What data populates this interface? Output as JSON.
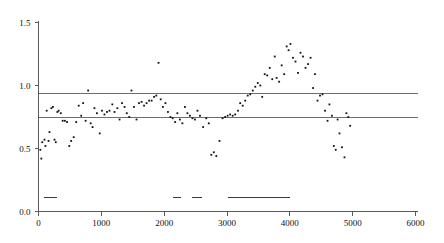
{
  "chart_data": {
    "type": "scatter",
    "title": "",
    "subtitle": "",
    "xlabel": "",
    "ylabel": "",
    "xlim": [
      0,
      6000
    ],
    "ylim": [
      0.0,
      1.5
    ],
    "grid": false,
    "legend": "none",
    "x_ticks": [
      0,
      1000,
      2000,
      3000,
      4000,
      5000,
      6000
    ],
    "x_tick_labels": [
      "0",
      "1000",
      "2000",
      "3000",
      "4000",
      "5000",
      "6000"
    ],
    "y_ticks": [
      0.0,
      0.5,
      1.0,
      1.5
    ],
    "y_tick_labels": [
      "0.0",
      "0.5",
      "1.0",
      "1.5"
    ],
    "marker": "small-filled-square",
    "marker_color": "#111111",
    "reference_lines": [
      {
        "name": "upper-threshold",
        "orientation": "horizontal",
        "y": 0.94,
        "color": "#6e6e6e"
      },
      {
        "name": "lower-threshold",
        "orientation": "horizontal",
        "y": 0.745,
        "color": "#6e6e6e"
      }
    ],
    "interval_bars": [
      {
        "name": "interval-1",
        "y": 0.11,
        "x_start": 95,
        "x_end": 290,
        "color": "#3c3c3c"
      },
      {
        "name": "interval-2",
        "y": 0.11,
        "x_start": 2135,
        "x_end": 2265,
        "color": "#3c3c3c"
      },
      {
        "name": "interval-3",
        "y": 0.11,
        "x_start": 2450,
        "x_end": 2610,
        "color": "#3c3c3c"
      },
      {
        "name": "interval-4",
        "y": 0.11,
        "x_start": 3020,
        "x_end": 4010,
        "color": "#3c3c3c"
      }
    ],
    "points": [
      {
        "x": 30,
        "y": 0.49
      },
      {
        "x": 45,
        "y": 0.42
      },
      {
        "x": 60,
        "y": 0.55
      },
      {
        "x": 95,
        "y": 0.57
      },
      {
        "x": 110,
        "y": 0.52
      },
      {
        "x": 130,
        "y": 0.8
      },
      {
        "x": 160,
        "y": 0.56
      },
      {
        "x": 175,
        "y": 0.63
      },
      {
        "x": 205,
        "y": 0.82
      },
      {
        "x": 230,
        "y": 0.83
      },
      {
        "x": 255,
        "y": 0.57
      },
      {
        "x": 275,
        "y": 0.55
      },
      {
        "x": 300,
        "y": 0.79
      },
      {
        "x": 320,
        "y": 0.8
      },
      {
        "x": 355,
        "y": 0.78
      },
      {
        "x": 385,
        "y": 0.72
      },
      {
        "x": 420,
        "y": 0.72
      },
      {
        "x": 455,
        "y": 0.71
      },
      {
        "x": 490,
        "y": 0.52
      },
      {
        "x": 520,
        "y": 0.56
      },
      {
        "x": 560,
        "y": 0.59
      },
      {
        "x": 600,
        "y": 0.71
      },
      {
        "x": 640,
        "y": 0.84
      },
      {
        "x": 680,
        "y": 0.76
      },
      {
        "x": 710,
        "y": 0.86
      },
      {
        "x": 750,
        "y": 0.72
      },
      {
        "x": 790,
        "y": 0.96
      },
      {
        "x": 830,
        "y": 0.7
      },
      {
        "x": 860,
        "y": 0.67
      },
      {
        "x": 890,
        "y": 0.82
      },
      {
        "x": 930,
        "y": 0.78
      },
      {
        "x": 975,
        "y": 0.62
      },
      {
        "x": 1010,
        "y": 0.8
      },
      {
        "x": 1050,
        "y": 0.77
      },
      {
        "x": 1090,
        "y": 0.79
      },
      {
        "x": 1130,
        "y": 0.8
      },
      {
        "x": 1175,
        "y": 0.85
      },
      {
        "x": 1210,
        "y": 0.79
      },
      {
        "x": 1255,
        "y": 0.82
      },
      {
        "x": 1290,
        "y": 0.73
      },
      {
        "x": 1330,
        "y": 0.86
      },
      {
        "x": 1370,
        "y": 0.83
      },
      {
        "x": 1405,
        "y": 0.78
      },
      {
        "x": 1445,
        "y": 0.75
      },
      {
        "x": 1480,
        "y": 0.96
      },
      {
        "x": 1520,
        "y": 0.83
      },
      {
        "x": 1560,
        "y": 0.73
      },
      {
        "x": 1600,
        "y": 0.86
      },
      {
        "x": 1640,
        "y": 0.87
      },
      {
        "x": 1680,
        "y": 0.84
      },
      {
        "x": 1720,
        "y": 0.86
      },
      {
        "x": 1760,
        "y": 0.88
      },
      {
        "x": 1800,
        "y": 0.88
      },
      {
        "x": 1840,
        "y": 0.91
      },
      {
        "x": 1875,
        "y": 0.92
      },
      {
        "x": 1910,
        "y": 1.18
      },
      {
        "x": 1945,
        "y": 0.89
      },
      {
        "x": 1980,
        "y": 0.83
      },
      {
        "x": 2020,
        "y": 0.86
      },
      {
        "x": 2060,
        "y": 0.79
      },
      {
        "x": 2100,
        "y": 0.75
      },
      {
        "x": 2135,
        "y": 0.74
      },
      {
        "x": 2175,
        "y": 0.71
      },
      {
        "x": 2210,
        "y": 0.78
      },
      {
        "x": 2250,
        "y": 0.73
      },
      {
        "x": 2290,
        "y": 0.7
      },
      {
        "x": 2330,
        "y": 0.83
      },
      {
        "x": 2370,
        "y": 0.78
      },
      {
        "x": 2410,
        "y": 0.76
      },
      {
        "x": 2450,
        "y": 0.74
      },
      {
        "x": 2490,
        "y": 0.73
      },
      {
        "x": 2530,
        "y": 0.8
      },
      {
        "x": 2570,
        "y": 0.76
      },
      {
        "x": 2620,
        "y": 0.67
      },
      {
        "x": 2670,
        "y": 0.74
      },
      {
        "x": 2710,
        "y": 0.7
      },
      {
        "x": 2750,
        "y": 0.45
      },
      {
        "x": 2790,
        "y": 0.47
      },
      {
        "x": 2830,
        "y": 0.44
      },
      {
        "x": 2880,
        "y": 0.56
      },
      {
        "x": 2930,
        "y": 0.74
      },
      {
        "x": 2970,
        "y": 0.75
      },
      {
        "x": 3010,
        "y": 0.76
      },
      {
        "x": 3050,
        "y": 0.77
      },
      {
        "x": 3090,
        "y": 0.76
      },
      {
        "x": 3130,
        "y": 0.77
      },
      {
        "x": 3175,
        "y": 0.8
      },
      {
        "x": 3210,
        "y": 0.86
      },
      {
        "x": 3250,
        "y": 0.84
      },
      {
        "x": 3290,
        "y": 0.88
      },
      {
        "x": 3330,
        "y": 0.92
      },
      {
        "x": 3370,
        "y": 0.93
      },
      {
        "x": 3410,
        "y": 0.96
      },
      {
        "x": 3450,
        "y": 0.99
      },
      {
        "x": 3490,
        "y": 1.02
      },
      {
        "x": 3530,
        "y": 1.0
      },
      {
        "x": 3560,
        "y": 0.91
      },
      {
        "x": 3600,
        "y": 1.09
      },
      {
        "x": 3640,
        "y": 1.08
      },
      {
        "x": 3680,
        "y": 1.14
      },
      {
        "x": 3720,
        "y": 1.05
      },
      {
        "x": 3760,
        "y": 1.23
      },
      {
        "x": 3790,
        "y": 1.06
      },
      {
        "x": 3830,
        "y": 1.03
      },
      {
        "x": 3870,
        "y": 1.16
      },
      {
        "x": 3910,
        "y": 1.09
      },
      {
        "x": 3950,
        "y": 1.31
      },
      {
        "x": 3980,
        "y": 1.28
      },
      {
        "x": 4010,
        "y": 1.33
      },
      {
        "x": 4050,
        "y": 1.22
      },
      {
        "x": 4090,
        "y": 1.19
      },
      {
        "x": 4130,
        "y": 1.1
      },
      {
        "x": 4170,
        "y": 1.26
      },
      {
        "x": 4210,
        "y": 1.23
      },
      {
        "x": 4250,
        "y": 1.14
      },
      {
        "x": 4290,
        "y": 1.17
      },
      {
        "x": 4330,
        "y": 1.22
      },
      {
        "x": 4370,
        "y": 0.98
      },
      {
        "x": 4400,
        "y": 1.09
      },
      {
        "x": 4440,
        "y": 0.88
      },
      {
        "x": 4480,
        "y": 0.92
      },
      {
        "x": 4520,
        "y": 0.93
      },
      {
        "x": 4560,
        "y": 0.8
      },
      {
        "x": 4600,
        "y": 0.72
      },
      {
        "x": 4630,
        "y": 0.85
      },
      {
        "x": 4670,
        "y": 0.76
      },
      {
        "x": 4700,
        "y": 0.52
      },
      {
        "x": 4730,
        "y": 0.49
      },
      {
        "x": 4760,
        "y": 0.73
      },
      {
        "x": 4790,
        "y": 0.62
      },
      {
        "x": 4830,
        "y": 0.51
      },
      {
        "x": 4870,
        "y": 0.43
      },
      {
        "x": 4900,
        "y": 0.78
      },
      {
        "x": 4930,
        "y": 0.75
      },
      {
        "x": 4960,
        "y": 0.68
      }
    ]
  }
}
